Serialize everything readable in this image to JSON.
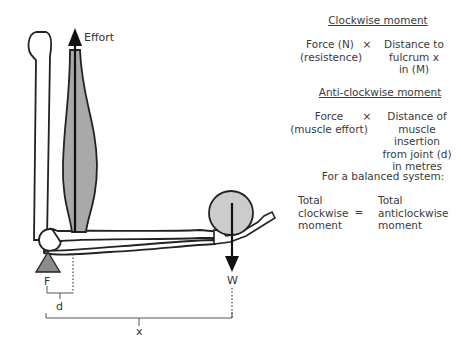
{
  "diagram": {
    "labels": {
      "effort": "Effort",
      "fulcrum": "F",
      "weight": "W",
      "distance_d": "d",
      "distance_x": "x"
    },
    "colors": {
      "muscle_fill": "#a9a9a9",
      "ball_fill": "#cccccc",
      "fulcrum_fill": "#8c8c8c",
      "line": "#222222"
    }
  },
  "explanation": {
    "clockwise": {
      "heading": "Clockwise moment",
      "left": [
        "Force (N)",
        "(resistence)"
      ],
      "operator": "×",
      "right": [
        "Distance to",
        "fulcrum x",
        "in (M)"
      ]
    },
    "anticlockwise": {
      "heading": "Anti-clockwise moment",
      "left": [
        "Force",
        "(muscle effort)"
      ],
      "operator": "×",
      "right": [
        "Distance of",
        "muscle insertion",
        "from joint (d)",
        "in metres"
      ]
    },
    "balanced": {
      "heading": "For a balanced system:",
      "left": [
        "Total",
        "clockwise",
        "moment"
      ],
      "operator": "=",
      "right": [
        "Total",
        "anticlockwise",
        "moment"
      ]
    }
  }
}
